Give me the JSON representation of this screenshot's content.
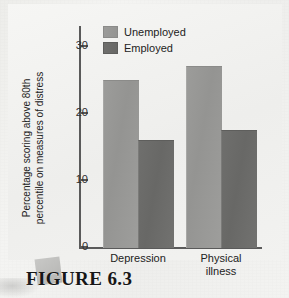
{
  "figure": {
    "caption": "FIGURE 6.3",
    "caption_tab_icon": "folder-tab-decoration"
  },
  "chart_data": {
    "type": "bar",
    "title": "",
    "categories": [
      "Depression",
      "Physical\nillness"
    ],
    "series": [
      {
        "name": "Unemployed",
        "values": [
          25,
          27
        ],
        "color": "#9a9a98"
      },
      {
        "name": "Employed",
        "values": [
          16,
          17.5
        ],
        "color": "#6e6e6c"
      }
    ],
    "xlabel": "",
    "ylabel": "Percentage scoring above 80th\npercentile on measures of distress",
    "ylim": [
      0,
      33
    ],
    "yticks": [
      0,
      10,
      20,
      30
    ],
    "ytick_labels": [
      "0",
      "10",
      "20",
      "30"
    ],
    "grid": false,
    "legend_position": "top-left-inside"
  },
  "legend": {
    "items": [
      {
        "label": "Unemployed",
        "swatch": "light"
      },
      {
        "label": "Employed",
        "swatch": "dark"
      }
    ]
  }
}
